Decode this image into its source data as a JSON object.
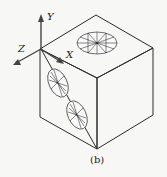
{
  "figure": {
    "caption": "(b)",
    "axes": {
      "x_label": "X",
      "y_label": "Y",
      "z_label": "Z"
    }
  }
}
